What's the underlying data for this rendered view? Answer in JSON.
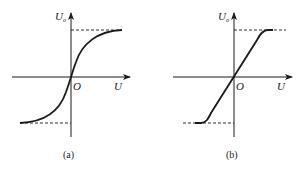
{
  "figure": {
    "panels": [
      {
        "id": "a",
        "caption": "(a)",
        "y_axis_label": "U",
        "y_axis_subscript": "o",
        "x_axis_label": "U",
        "origin_label": "O",
        "curve_type": "smooth sigmoid saturation"
      },
      {
        "id": "b",
        "caption": "(b)",
        "y_axis_label": "U",
        "y_axis_subscript": "o",
        "x_axis_label": "U",
        "origin_label": "O",
        "curve_type": "linear with sharp saturation"
      }
    ],
    "colors": {
      "stroke": "#1a1a1a",
      "background": "#ffffff"
    }
  }
}
